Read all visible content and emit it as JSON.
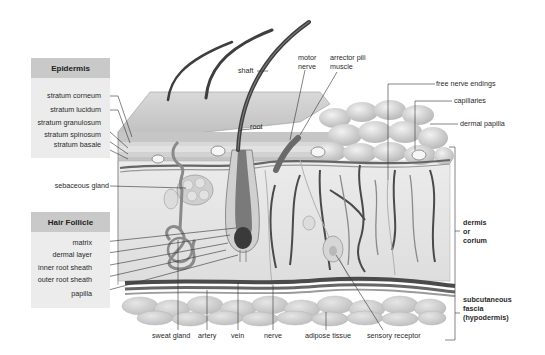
{
  "diagram": {
    "panels": {
      "epidermis": {
        "title": "Epidermis",
        "labels": [
          "stratum corneum",
          "stratum lucidum",
          "stratum granulosum",
          "stratum spinosum",
          "stratum basale"
        ]
      },
      "hair_follicle": {
        "title": "Hair Follicle",
        "labels": [
          "matrix",
          "dermal layer",
          "inner root sheath",
          "outer root sheath",
          "papilla"
        ]
      }
    },
    "left_labels": {
      "sebaceous_gland": "sebaceous gland"
    },
    "top_labels": {
      "shaft": "shaft",
      "root": "root",
      "motor_nerve_1": "motor",
      "motor_nerve_2": "nerve",
      "arrector_1": "arrector pili",
      "arrector_2": "muscle"
    },
    "right_labels": {
      "free_nerve_endings": "free nerve endings",
      "capillaries": "capillaries",
      "dermal_papilla": "dermal papilla",
      "dermis_1": "dermis",
      "dermis_2": "or",
      "dermis_3": "corium",
      "subq_1": "subcutaneous",
      "subq_2": "fascia",
      "subq_3": "(hypodermis)"
    },
    "bottom_labels": [
      "sweat gland",
      "artery",
      "vein",
      "nerve",
      "adipose tissue",
      "sensory receptor"
    ],
    "colors": {
      "panel_bg": "#ececec",
      "panel_head": "#c9c9c9",
      "tissue_light": "#e4e4e4",
      "epidermis": "#cfcfcf",
      "vessel_dark": "#555555",
      "fat": "#d4d4d4",
      "leader": "#333333"
    }
  }
}
